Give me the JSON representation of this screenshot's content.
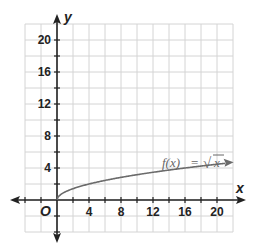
{
  "chart_data": {
    "type": "line",
    "title": "",
    "function_label": "f(x) = √x",
    "function_parts": {
      "lhs": "f(x)",
      "eq": "=",
      "sqrt": "√",
      "arg": "x"
    },
    "xlabel": "x",
    "ylabel": "y",
    "origin_label": "O",
    "xlim": [
      -4,
      22
    ],
    "ylim": [
      -4,
      22
    ],
    "grid": true,
    "grid_step": 2,
    "x_ticks": [
      4,
      8,
      12,
      16,
      20
    ],
    "y_ticks": [
      4,
      8,
      12,
      16,
      20
    ],
    "series": [
      {
        "name": "f(x) = √x",
        "x": [
          0,
          1,
          2,
          4,
          6,
          8,
          10,
          12,
          14,
          16,
          18,
          20,
          22
        ],
        "y": [
          0,
          1,
          1.41,
          2,
          2.45,
          2.83,
          3.16,
          3.46,
          3.74,
          4,
          4.24,
          4.47,
          4.69
        ]
      }
    ],
    "colors": {
      "curve": "#6b6b6b",
      "axes": "#222222",
      "grid": "#d0d0d0"
    }
  }
}
